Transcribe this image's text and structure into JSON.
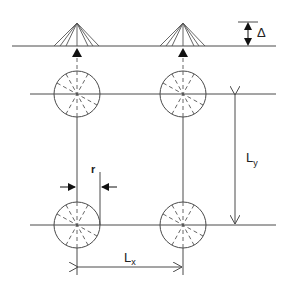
{
  "diagram": {
    "type": "structural-layout",
    "colors": {
      "line": "#4a4a4a",
      "dashed": "#555555",
      "arrow": "#111111",
      "background": "#ffffff"
    },
    "labels": {
      "delta": "Δ",
      "ly_main": "L",
      "ly_sub": "y",
      "lx_main": "L",
      "lx_sub": "x",
      "radius": "r"
    },
    "top_row": {
      "description": "Deflected slab line with cone-shaped peaks over supports",
      "peaks": [
        {
          "x": 77
        },
        {
          "x": 183
        }
      ]
    },
    "grid": {
      "rows": [
        {
          "y": 94
        },
        {
          "y": 225
        }
      ],
      "columns": [
        {
          "x": 77
        },
        {
          "x": 183
        }
      ],
      "circle_radius": 23
    },
    "dimensions": [
      {
        "name": "delta",
        "label": "Δ",
        "meaning": "vertical deflection"
      },
      {
        "name": "Ly",
        "label": "Ly",
        "meaning": "span in y direction"
      },
      {
        "name": "Lx",
        "label": "Lx",
        "meaning": "span in x direction"
      },
      {
        "name": "r",
        "label": "r",
        "meaning": "column radius"
      }
    ]
  }
}
